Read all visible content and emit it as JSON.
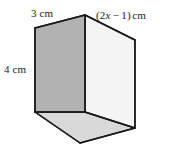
{
  "figure": {
    "type": "geometric-solid",
    "shape": "rectangular-prism",
    "colors": {
      "left_face": "#b2b2b2",
      "right_face": "#f4f4f4",
      "bottom_face": "#d9d9d9",
      "edge": "#1a1a1a",
      "background": "#ffffff",
      "text": "#1a1a1a"
    },
    "labels": {
      "top_width": {
        "value": "3",
        "unit": "cm",
        "text": "3 cm",
        "edge": "top-left-edge"
      },
      "left_height": {
        "value": "4",
        "unit": "cm",
        "text": "4 cm",
        "edge": "left-vertical-edge"
      },
      "depth": {
        "open_paren": "(",
        "coefficient": "2",
        "variable": "x",
        "operator": "−",
        "constant": "1",
        "close_paren": ")",
        "unit": "cm",
        "text": "(2x − 1) cm",
        "edge": "top-right-edge"
      }
    },
    "vertices": {
      "top_front": [
        85,
        15
      ],
      "top_left_back": [
        35,
        28
      ],
      "top_right_back": [
        135,
        40
      ],
      "bottom_front_inner": [
        85,
        112
      ],
      "bottom_left": [
        35,
        112
      ],
      "bottom_right": [
        135,
        128
      ],
      "bottom_front_outer": [
        80,
        143
      ]
    }
  }
}
